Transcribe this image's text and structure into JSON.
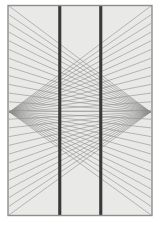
{
  "figure": {
    "title": "Hering illusion",
    "caption": "",
    "type": "optical-illusion-diagram",
    "canvas": {
      "width": 160,
      "height": 231,
      "background": "#ffffff"
    }
  },
  "frame": {
    "x": 8,
    "y": 5.5,
    "width": 144,
    "height": 210,
    "fill": "#e9e9e7",
    "stroke": "#8e8e8c",
    "stroke_width": 1.4
  },
  "vanishing_points": [
    {
      "name": "left-vanishing-point",
      "x": 9.5,
      "y": 112
    },
    {
      "name": "right-vanishing-point",
      "x": 150.5,
      "y": 112
    }
  ],
  "radial_lines": {
    "count_per_side": 25,
    "color": "#8c8c8a",
    "stroke_width": 0.62,
    "opacity": 0.95,
    "spread_top": 6,
    "spread_bottom": 215,
    "description": "Fan of straight lines radiating from each vanishing point to evenly spaced points along the opposite vertical edge of the frame."
  },
  "vertical_bars": [
    {
      "name": "left-vertical-bar",
      "x": 58.2,
      "width": 3.1,
      "top": 6,
      "bottom": 215,
      "color": "#3a3a3a"
    },
    {
      "name": "right-vertical-bar",
      "x": 99.2,
      "width": 3.1,
      "top": 6,
      "bottom": 215,
      "color": "#3a3a3a"
    }
  ],
  "colors": {
    "page_background": "#ffffff",
    "panel_fill": "#e9e9e7",
    "panel_border": "#8e8e8c",
    "line_gray": "#8c8c8a",
    "bar_dark": "#3a3a3a"
  },
  "chart_data": {
    "type": "line",
    "title": "Hering illusion",
    "xlabel": "",
    "ylabel": "",
    "xlim": [
      8,
      152
    ],
    "ylim": [
      5.5,
      215.5
    ],
    "grid": false,
    "legend": "none",
    "annotations": [],
    "series": [
      {
        "name": "left-fan",
        "origin": [
          9.5,
          112
        ],
        "target_x": 151,
        "n_rays": 25,
        "target_y_start": 6,
        "target_y_end": 215
      },
      {
        "name": "right-fan",
        "origin": [
          150.5,
          112
        ],
        "target_x": 9,
        "n_rays": 25,
        "target_y_start": 6,
        "target_y_end": 215
      },
      {
        "name": "vertical-bars",
        "x": [
          58.2,
          99.2
        ],
        "y_start": 6,
        "y_end": 215
      }
    ]
  }
}
